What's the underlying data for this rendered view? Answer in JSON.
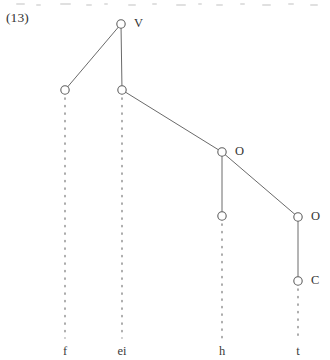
{
  "figure": {
    "example_number": "(13)",
    "type": "syntactic-tree-diagram",
    "ink_color": "#6a6a6a",
    "node_stroke_color": "#5f5f5f",
    "text_color": "#333333",
    "background_color": "#ffffff",
    "canvas": {
      "width": 330,
      "height": 360
    },
    "nodes": [
      {
        "id": "n1",
        "label": "V",
        "x": 121,
        "y": 24,
        "label_dx": 13,
        "label_dy": -7
      },
      {
        "id": "n2",
        "label": "",
        "x": 65,
        "y": 90,
        "label_dx": 0,
        "label_dy": 0
      },
      {
        "id": "n3",
        "label": "",
        "x": 122,
        "y": 90,
        "label_dx": 0,
        "label_dy": 0
      },
      {
        "id": "n4",
        "label": "O",
        "x": 222,
        "y": 152,
        "label_dx": 13,
        "label_dy": -7
      },
      {
        "id": "n5",
        "label": "",
        "x": 222,
        "y": 216,
        "label_dx": 0,
        "label_dy": 0
      },
      {
        "id": "n6",
        "label": "O",
        "x": 298,
        "y": 217,
        "label_dx": 13,
        "label_dy": -7
      },
      {
        "id": "n7",
        "label": "C",
        "x": 298,
        "y": 281,
        "label_dx": 13,
        "label_dy": -7
      }
    ],
    "edges": [
      {
        "from": "n1",
        "to": "n2",
        "style": "solid"
      },
      {
        "from": "n1",
        "to": "n3",
        "style": "solid"
      },
      {
        "from": "n3",
        "to": "n4",
        "style": "solid"
      },
      {
        "from": "n4",
        "to": "n5",
        "style": "solid"
      },
      {
        "from": "n4",
        "to": "n6",
        "style": "solid"
      },
      {
        "from": "n6",
        "to": "n7",
        "style": "solid"
      }
    ],
    "association_lines": [
      {
        "from": "n2",
        "x": 65,
        "y_start": 98,
        "y_end": 338,
        "style": "dotted"
      },
      {
        "from": "n3",
        "x": 122,
        "y_start": 98,
        "y_end": 338,
        "style": "dotted"
      },
      {
        "from": "n5",
        "x": 222,
        "y_start": 224,
        "y_end": 338,
        "style": "dotted"
      },
      {
        "from": "n7",
        "x": 298,
        "y_start": 289,
        "y_end": 338,
        "style": "dotted"
      }
    ],
    "terminals": [
      {
        "label": "f",
        "x": 65,
        "y": 345
      },
      {
        "label": "ei",
        "x": 122,
        "y": 345
      },
      {
        "label": "h",
        "x": 222,
        "y": 345
      },
      {
        "label": "t",
        "x": 298,
        "y": 345
      }
    ],
    "node_radius": 4.2
  }
}
